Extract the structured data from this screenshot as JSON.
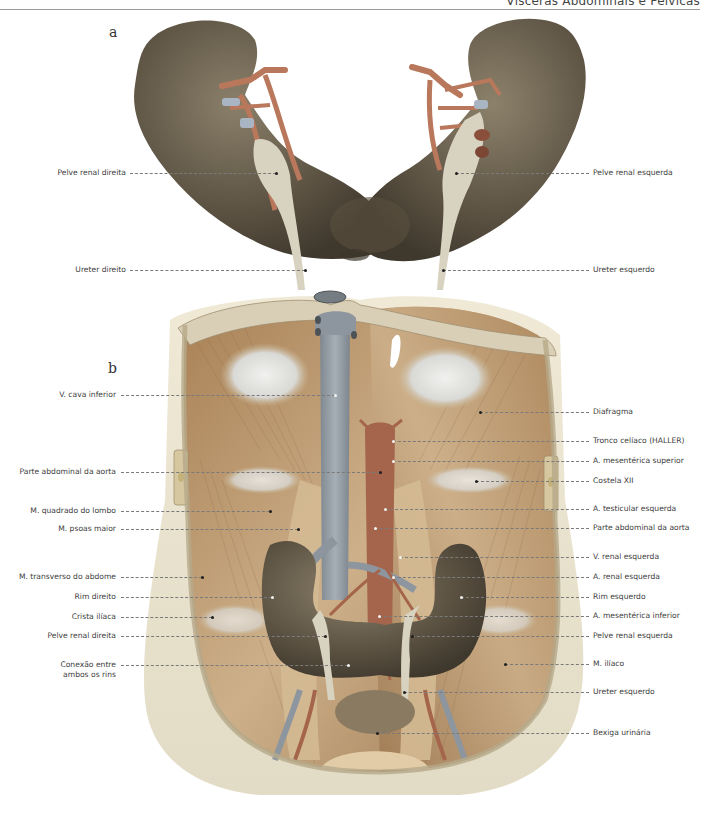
{
  "header": {
    "title": "Vísceras Abdominais e Pélvicas"
  },
  "figure_a": {
    "letter": "a",
    "labels_left": [
      {
        "text": "Pelve renal direita",
        "y": 173,
        "line_to": 276
      },
      {
        "text": "Ureter direito",
        "y": 270,
        "line_to": 305
      }
    ],
    "labels_right": [
      {
        "text": "Pelve renal esquerda",
        "y": 173,
        "line_from": 456
      },
      {
        "text": "Ureter esquerdo",
        "y": 270,
        "line_from": 443
      }
    ]
  },
  "figure_b": {
    "letter": "b",
    "labels_left": [
      {
        "text": "V. cava inferior",
        "y": 395,
        "line_to": 335
      },
      {
        "text": "Parte abdominal da aorta",
        "y": 472,
        "line_to": 380
      },
      {
        "text": "M. quadrado do lombo",
        "y": 511,
        "line_to": 270
      },
      {
        "text": "M. psoas maior",
        "y": 529,
        "line_to": 298
      },
      {
        "text": "M. transverso do abdome",
        "y": 577,
        "line_to": 202
      },
      {
        "text": "Rim direito",
        "y": 597,
        "line_to": 272
      },
      {
        "text": "Crista ilíaca",
        "y": 617,
        "line_to": 212
      },
      {
        "text": "Pelve renal direita",
        "y": 636,
        "line_to": 325
      },
      {
        "text": "Conexão entre",
        "text2": "ambos os rins",
        "y": 665,
        "line_to": 348
      }
    ],
    "labels_right": [
      {
        "text": "Diafragma",
        "y": 412,
        "line_from": 480
      },
      {
        "text": "Tronco celíaco (HALLER)",
        "y": 441,
        "line_from": 393
      },
      {
        "text": "A. mesentérica superior",
        "y": 461,
        "line_from": 393
      },
      {
        "text": "Costela XII",
        "y": 481,
        "line_from": 476
      },
      {
        "text": "A. testicular esquerda",
        "y": 509,
        "line_from": 385
      },
      {
        "text": "Parte abdominal da aorta",
        "y": 528,
        "line_from": 375
      },
      {
        "text": "V. renal esquerda",
        "y": 557,
        "line_from": 400
      },
      {
        "text": "A. renal esquerda",
        "y": 577,
        "line_from": 393
      },
      {
        "text": "Rim esquerdo",
        "y": 597,
        "line_from": 461
      },
      {
        "text": "A. mesentérica inferior",
        "y": 616,
        "line_from": 379
      },
      {
        "text": "Pelve renal esquerda",
        "y": 636,
        "line_from": 412
      },
      {
        "text": "M. ilíaco",
        "y": 664,
        "line_from": 505
      },
      {
        "text": "Ureter esquerdo",
        "y": 692,
        "line_from": 404
      },
      {
        "text": "Bexiga urinária",
        "y": 733,
        "line_from": 377
      }
    ]
  },
  "colors": {
    "kidney": "#5e5444",
    "kidney_light": "#8a7f68",
    "artery": "#b9785c",
    "vein": "#9aa3ab",
    "pelvis_ureter": "#d8d2c0",
    "muscle": "#b89368",
    "muscle_light": "#d8bf96",
    "tendon": "#e7e6e2",
    "skin": "#ece6d2",
    "aorta": "#a4654c"
  }
}
